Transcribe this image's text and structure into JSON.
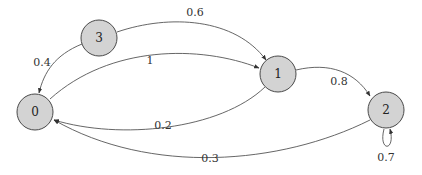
{
  "diagram": {
    "type": "markov-chain-graph",
    "nodes": [
      {
        "id": "0",
        "label": "0"
      },
      {
        "id": "1",
        "label": "1"
      },
      {
        "id": "2",
        "label": "2"
      },
      {
        "id": "3",
        "label": "3"
      }
    ],
    "edges": [
      {
        "from": "3",
        "to": "1",
        "label": "0.6"
      },
      {
        "from": "3",
        "to": "0",
        "label": "0.4"
      },
      {
        "from": "0",
        "to": "1",
        "label": "1"
      },
      {
        "from": "1",
        "to": "2",
        "label": "0.8"
      },
      {
        "from": "1",
        "to": "0",
        "label": "0.2"
      },
      {
        "from": "2",
        "to": "0",
        "label": "0.3"
      },
      {
        "from": "2",
        "to": "2",
        "label": "0.7"
      }
    ],
    "colors": {
      "node_fill": "#d3d3d3",
      "stroke": "#4a4a4a"
    }
  }
}
